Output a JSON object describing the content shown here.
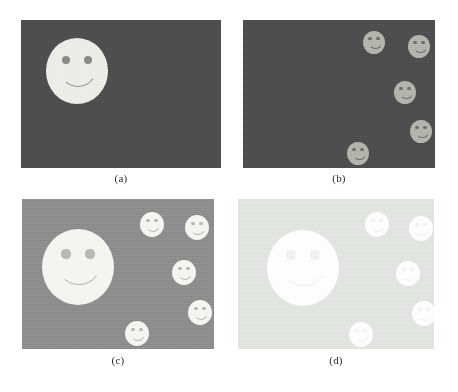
{
  "figure": {
    "width": 458,
    "height": 392,
    "background": "#ffffff",
    "layout": "2x2 grid of image panels with lettered captions below each panel"
  },
  "panels": [
    {
      "id": "a",
      "caption": "(a)",
      "box": {
        "x": 21,
        "y": 20,
        "w": 200,
        "h": 148
      },
      "caption_y": 172,
      "background": "#4e4e4e",
      "face_color": "#ecece8",
      "feature_color": "#8a8a86",
      "description": "Dark background with a single medium smiley face on the left",
      "faces": [
        {
          "name": "face-medium",
          "cx": 77,
          "cy": 69,
          "r": 31,
          "eye_r": 4.0,
          "eye_dx": 11,
          "eye_dy": -9,
          "mouth_w": 32,
          "mouth_h": 13,
          "mouth_dy": 9,
          "mouth_border": 1.6
        }
      ]
    },
    {
      "id": "b",
      "caption": "(b)",
      "box": {
        "x": 243,
        "y": 20,
        "w": 192,
        "h": 148
      },
      "caption_y": 172,
      "background": "#4e4e4e",
      "face_color": "#b4b4ae",
      "feature_color": "#6e6e6a",
      "description": "Dark background with five small smiley faces scattered on the right side",
      "faces": [
        {
          "name": "face-small-1",
          "cx": 374,
          "cy": 42,
          "r": 11,
          "eye_r": 1.7,
          "eye_dx": 4.0,
          "eye_dy": -3.2,
          "mouth_w": 11,
          "mouth_h": 4.6,
          "mouth_dy": 3.2,
          "mouth_border": 1.0
        },
        {
          "name": "face-small-2",
          "cx": 419,
          "cy": 46,
          "r": 11,
          "eye_r": 1.7,
          "eye_dx": 4.0,
          "eye_dy": -3.2,
          "mouth_w": 11,
          "mouth_h": 4.6,
          "mouth_dy": 3.2,
          "mouth_border": 1.0
        },
        {
          "name": "face-small-3",
          "cx": 405,
          "cy": 92,
          "r": 11,
          "eye_r": 1.7,
          "eye_dx": 4.0,
          "eye_dy": -3.2,
          "mouth_w": 11,
          "mouth_h": 4.6,
          "mouth_dy": 3.2,
          "mouth_border": 1.0
        },
        {
          "name": "face-small-4",
          "cx": 421,
          "cy": 131,
          "r": 11,
          "eye_r": 1.7,
          "eye_dx": 4.0,
          "eye_dy": -3.2,
          "mouth_w": 11,
          "mouth_h": 4.6,
          "mouth_dy": 3.2,
          "mouth_border": 1.0
        },
        {
          "name": "face-small-5",
          "cx": 358,
          "cy": 153,
          "r": 11,
          "eye_r": 1.7,
          "eye_dx": 4.0,
          "eye_dy": -3.2,
          "mouth_w": 11,
          "mouth_h": 4.6,
          "mouth_dy": 3.2,
          "mouth_border": 1.0
        }
      ]
    },
    {
      "id": "c",
      "caption": "(c)",
      "box": {
        "x": 22,
        "y": 199,
        "w": 192,
        "h": 150
      },
      "caption_y": 354,
      "background": "#8e8e8e",
      "face_color": "#f4f4f0",
      "feature_color": "#b8b8b4",
      "description": "Medium gray background with one large smiley face at left and five small smiley faces at right",
      "faces": [
        {
          "name": "face-large",
          "cx": 78,
          "cy": 265,
          "r": 36,
          "eye_r": 4.6,
          "eye_dx": 12,
          "eye_dy": -11,
          "mouth_w": 38,
          "mouth_h": 15,
          "mouth_dy": 10,
          "mouth_border": 1.8
        },
        {
          "name": "face-small-1",
          "cx": 152,
          "cy": 224,
          "r": 12,
          "eye_r": 1.8,
          "eye_dx": 4.2,
          "eye_dy": -3.4,
          "mouth_w": 12,
          "mouth_h": 5.0,
          "mouth_dy": 3.4,
          "mouth_border": 1.1
        },
        {
          "name": "face-small-2",
          "cx": 197,
          "cy": 227,
          "r": 12,
          "eye_r": 1.8,
          "eye_dx": 4.2,
          "eye_dy": -3.4,
          "mouth_w": 12,
          "mouth_h": 5.0,
          "mouth_dy": 3.4,
          "mouth_border": 1.1
        },
        {
          "name": "face-small-3",
          "cx": 184,
          "cy": 272,
          "r": 12,
          "eye_r": 1.8,
          "eye_dx": 4.2,
          "eye_dy": -3.4,
          "mouth_w": 12,
          "mouth_h": 5.0,
          "mouth_dy": 3.4,
          "mouth_border": 1.1
        },
        {
          "name": "face-small-4",
          "cx": 200,
          "cy": 312,
          "r": 12,
          "eye_r": 1.8,
          "eye_dx": 4.2,
          "eye_dy": -3.4,
          "mouth_w": 12,
          "mouth_h": 5.0,
          "mouth_dy": 3.4,
          "mouth_border": 1.1
        },
        {
          "name": "face-small-5",
          "cx": 137,
          "cy": 333,
          "r": 12,
          "eye_r": 1.8,
          "eye_dx": 4.2,
          "eye_dy": -3.4,
          "mouth_w": 12,
          "mouth_h": 5.0,
          "mouth_dy": 3.4,
          "mouth_border": 1.1
        }
      ]
    },
    {
      "id": "d",
      "caption": "(d)",
      "box": {
        "x": 238,
        "y": 199,
        "w": 196,
        "h": 150
      },
      "caption_y": 354,
      "background": "#e2e4e2",
      "face_color": "#fdfdfd",
      "feature_color": "#f0f0ee",
      "description": "Very light washed-out background; large face appears as a featureless white blob and five small faces are barely visible",
      "faces": [
        {
          "name": "face-large",
          "cx": 303,
          "cy": 266,
          "r": 36,
          "eye_r": 4.6,
          "eye_dx": 12,
          "eye_dy": -11,
          "mouth_w": 38,
          "mouth_h": 15,
          "mouth_dy": 10,
          "mouth_border": 1.8
        },
        {
          "name": "face-small-1",
          "cx": 377,
          "cy": 224,
          "r": 12,
          "eye_r": 1.8,
          "eye_dx": 4.2,
          "eye_dy": -3.4,
          "mouth_w": 12,
          "mouth_h": 5.0,
          "mouth_dy": 3.4,
          "mouth_border": 1.1
        },
        {
          "name": "face-small-2",
          "cx": 421,
          "cy": 228,
          "r": 12,
          "eye_r": 1.8,
          "eye_dx": 4.2,
          "eye_dy": -3.4,
          "mouth_w": 12,
          "mouth_h": 5.0,
          "mouth_dy": 3.4,
          "mouth_border": 1.1
        },
        {
          "name": "face-small-3",
          "cx": 408,
          "cy": 273,
          "r": 12,
          "eye_r": 1.8,
          "eye_dx": 4.2,
          "eye_dy": -3.4,
          "mouth_w": 12,
          "mouth_h": 5.0,
          "mouth_dy": 3.4,
          "mouth_border": 1.1
        },
        {
          "name": "face-small-4",
          "cx": 424,
          "cy": 313,
          "r": 12,
          "eye_r": 1.8,
          "eye_dx": 4.2,
          "eye_dy": -3.4,
          "mouth_w": 12,
          "mouth_h": 5.0,
          "mouth_dy": 3.4,
          "mouth_border": 1.1
        },
        {
          "name": "face-small-5",
          "cx": 361,
          "cy": 334,
          "r": 12,
          "eye_r": 1.8,
          "eye_dx": 4.2,
          "eye_dy": -3.4,
          "mouth_w": 12,
          "mouth_h": 5.0,
          "mouth_dy": 3.4,
          "mouth_border": 1.1
        }
      ]
    }
  ]
}
